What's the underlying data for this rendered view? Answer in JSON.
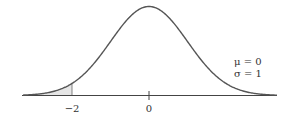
{
  "chart_data": {
    "type": "area",
    "title": "",
    "distribution": "normal",
    "parameters": {
      "mu": 0,
      "sigma": 1
    },
    "x_ticks": [
      -2,
      0
    ],
    "tick_labels": [
      "−2",
      "0"
    ],
    "shaded_region": {
      "from": "-inf",
      "to": -2
    },
    "annotation": [
      "μ = 0",
      "σ = 1"
    ],
    "xlim": [
      -3.3,
      3.4
    ],
    "grid": false,
    "legend": "none"
  },
  "labels": {
    "tick_neg2": "−2",
    "tick_0": "0",
    "mu_line": "μ = 0",
    "sigma_line": "σ = 1"
  },
  "colors": {
    "curve": "#555555",
    "axis": "#444444",
    "shade": "#e6e6e6"
  }
}
